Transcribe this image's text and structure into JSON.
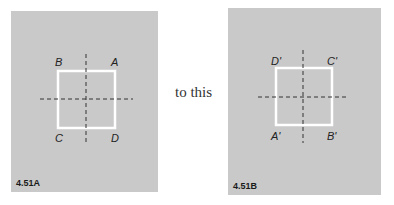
{
  "panels": [
    {
      "figure_label": "4.51A",
      "vertices": {
        "top_left": "B",
        "top_right": "A",
        "bottom_left": "C",
        "bottom_right": "D"
      }
    },
    {
      "figure_label": "4.51B",
      "vertices": {
        "top_left": "D'",
        "top_right": "C'",
        "bottom_left": "A'",
        "bottom_right": "B'"
      }
    }
  ],
  "connector_text": "to this",
  "colors": {
    "panel_bg": "#c9c9c9",
    "square": "#ffffff",
    "axis": "#333333"
  }
}
